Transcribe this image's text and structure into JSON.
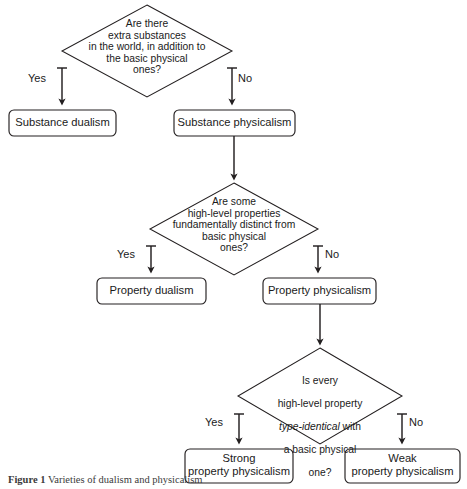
{
  "figure": {
    "caption_label": "Figure 1",
    "caption_text": "Varieties of dualism and physicalism",
    "background_color": "#ffffff",
    "line_color": "#231f20"
  },
  "nodes": {
    "diamond1": {
      "id": "d1",
      "shape": "diamond",
      "text": "Are there\nextra substances\nin the world, in addition to\nthe basic physical\nones?"
    },
    "diamond2": {
      "id": "d2",
      "shape": "diamond",
      "text": "Are some\nhigh-level properties\nfundamentally distinct from\nbasic physical\nones?"
    },
    "diamond3": {
      "id": "d3",
      "shape": "diamond",
      "line1": "Is every",
      "line2": "high-level property",
      "line3_italic": "type-identical",
      "line3_rest": " with",
      "line4": "a basic physical",
      "line5": "one?"
    },
    "box_substance_dualism": {
      "id": "b1",
      "shape": "rounded-box",
      "text": "Substance dualism"
    },
    "box_substance_physicalism": {
      "id": "b2",
      "shape": "rounded-box",
      "text": "Substance physicalism"
    },
    "box_property_dualism": {
      "id": "b3",
      "shape": "rounded-box",
      "text": "Property dualism"
    },
    "box_property_physicalism": {
      "id": "b4",
      "shape": "rounded-box",
      "text": "Property physicalism"
    },
    "box_strong_property_physicalism": {
      "id": "b5",
      "shape": "rounded-box",
      "text": "Strong\nproperty physicalism"
    },
    "box_weak_property_physicalism": {
      "id": "b6",
      "shape": "rounded-box",
      "text": "Weak\nproperty physicalism"
    }
  },
  "edge_labels": {
    "d1_yes": "Yes",
    "d1_no": "No",
    "d2_yes": "Yes",
    "d2_no": "No",
    "d3_yes": "Yes",
    "d3_no": "No"
  }
}
